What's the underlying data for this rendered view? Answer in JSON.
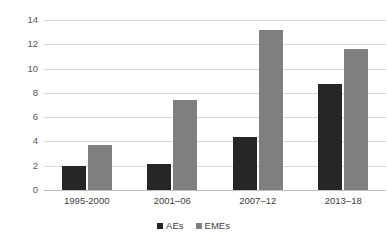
{
  "chart_data": {
    "type": "bar",
    "title": "",
    "subtitle": "",
    "xlabel": "",
    "ylabel": "",
    "categories": [
      "1995-2000",
      "2001–06",
      "2007–12",
      "2013–18"
    ],
    "series": [
      {
        "name": "AEs",
        "color": "#262626",
        "values": [
          1.95,
          2.15,
          4.35,
          8.7
        ]
      },
      {
        "name": "EMEs",
        "color": "#7f7f7f",
        "values": [
          3.7,
          7.45,
          13.2,
          11.65
        ]
      }
    ],
    "ylim": [
      0,
      14
    ],
    "ytick_step": 2,
    "yticks": [
      "0",
      "2",
      "4",
      "6",
      "8",
      "10",
      "12",
      "14"
    ],
    "grid": "horizontal",
    "legend_position": "bottom-center",
    "background_color": "#ffffff",
    "gridline_color": "#d9d9d9"
  },
  "legend": {
    "entries": [
      {
        "label": "AEs",
        "color": "#262626"
      },
      {
        "label": "EMEs",
        "color": "#7f7f7f"
      }
    ]
  }
}
